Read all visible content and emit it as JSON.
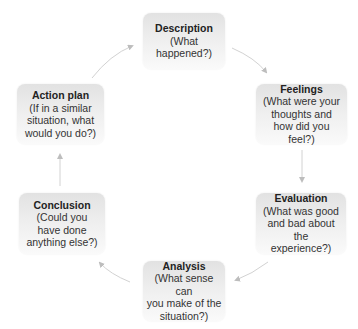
{
  "diagram": {
    "type": "cycle",
    "colors": {
      "node_fill_top": "#e2e2e2",
      "node_fill_bottom": "#fafafa",
      "text": "#333333",
      "arrow": "#c8c8c8"
    },
    "nodes": [
      {
        "id": "description",
        "title": "Description",
        "desc_lines": [
          "(What",
          "happened?)"
        ]
      },
      {
        "id": "feelings",
        "title": "Feelings",
        "desc_lines": [
          "(What were your",
          "thoughts and",
          "how did you feel?)"
        ]
      },
      {
        "id": "evaluation",
        "title": "Evaluation",
        "desc_lines": [
          "(What was good",
          "and bad about the",
          "experience?)"
        ]
      },
      {
        "id": "analysis",
        "title": "Analysis",
        "desc_lines": [
          "(What sense can",
          "you make of the",
          "situation?)"
        ]
      },
      {
        "id": "conclusion",
        "title": "Conclusion",
        "desc_lines": [
          "(Could you",
          "have done",
          "anything else?)"
        ]
      },
      {
        "id": "action_plan",
        "title": "Action plan",
        "desc_lines": [
          "(If in a similar",
          "situation, what",
          "would you do?)"
        ]
      }
    ],
    "edges": [
      {
        "from": "description",
        "to": "feelings"
      },
      {
        "from": "feelings",
        "to": "evaluation"
      },
      {
        "from": "evaluation",
        "to": "analysis"
      },
      {
        "from": "analysis",
        "to": "conclusion"
      },
      {
        "from": "conclusion",
        "to": "action_plan"
      },
      {
        "from": "action_plan",
        "to": "description"
      }
    ]
  }
}
